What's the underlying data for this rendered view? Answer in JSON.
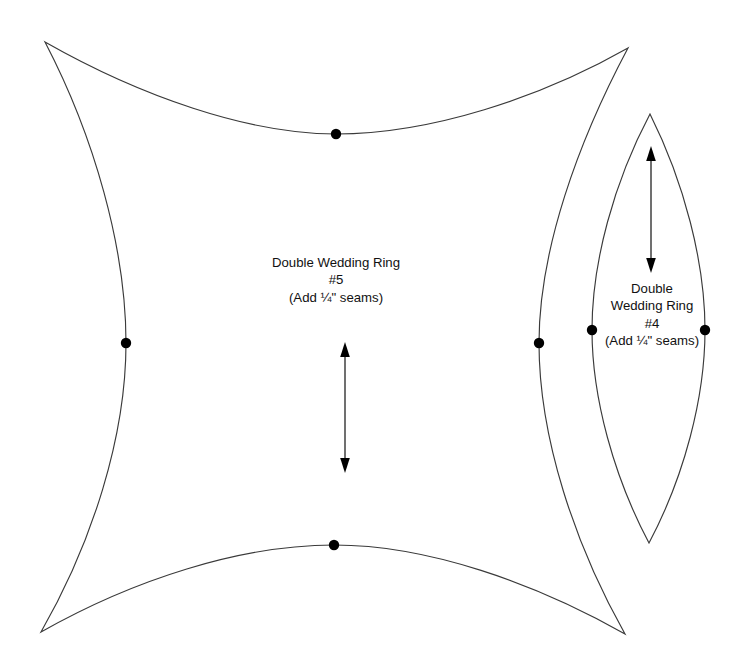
{
  "document": {
    "kind": "quilt-pattern-template-sheet",
    "background_color": "#ffffff",
    "line_color": "#3a3a3a",
    "dot_color": "#000000",
    "width": 746,
    "height": 663
  },
  "pieces": [
    {
      "id": "piece-5",
      "shape": "concave-square",
      "label_lines": [
        "Double Wedding Ring",
        "#5",
        "(Add ¼\" seams)"
      ],
      "title": "Double Wedding Ring",
      "number": "#5",
      "seam_note": "(Add ¼\" seams)",
      "cusps": [
        {
          "name": "top-left",
          "x": 45,
          "y": 42
        },
        {
          "name": "top-right",
          "x": 628,
          "y": 48
        },
        {
          "name": "bottom-right",
          "x": 625,
          "y": 634
        },
        {
          "name": "bottom-left",
          "x": 41,
          "y": 632
        }
      ],
      "seam_dots": [
        {
          "name": "top-center-dot",
          "x": 336,
          "y": 134
        },
        {
          "name": "left-center-dot",
          "x": 126,
          "y": 343
        },
        {
          "name": "right-center-dot",
          "x": 539,
          "y": 343
        },
        {
          "name": "bottom-center-dot",
          "x": 334,
          "y": 545
        }
      ],
      "grain_arrow": {
        "x": 345,
        "y_top": 343,
        "y_bottom": 472
      }
    },
    {
      "id": "piece-4",
      "shape": "pointed-oval-lens",
      "label_lines": [
        "Double",
        "Wedding Ring",
        "#4",
        "(Add ¼\" seams)"
      ],
      "title_line_1": "Double",
      "title_line_2": "Wedding Ring",
      "number": "#4",
      "seam_note": "(Add ¼\" seams)",
      "tips": [
        {
          "name": "top-tip",
          "x": 650,
          "y": 114
        },
        {
          "name": "bottom-tip",
          "x": 649,
          "y": 543
        }
      ],
      "seam_dots": [
        {
          "name": "left-center-dot",
          "x": 592,
          "y": 330
        },
        {
          "name": "right-center-dot",
          "x": 705,
          "y": 330
        }
      ],
      "grain_arrow": {
        "x": 651,
        "y_top": 147,
        "y_bottom": 272
      }
    }
  ]
}
